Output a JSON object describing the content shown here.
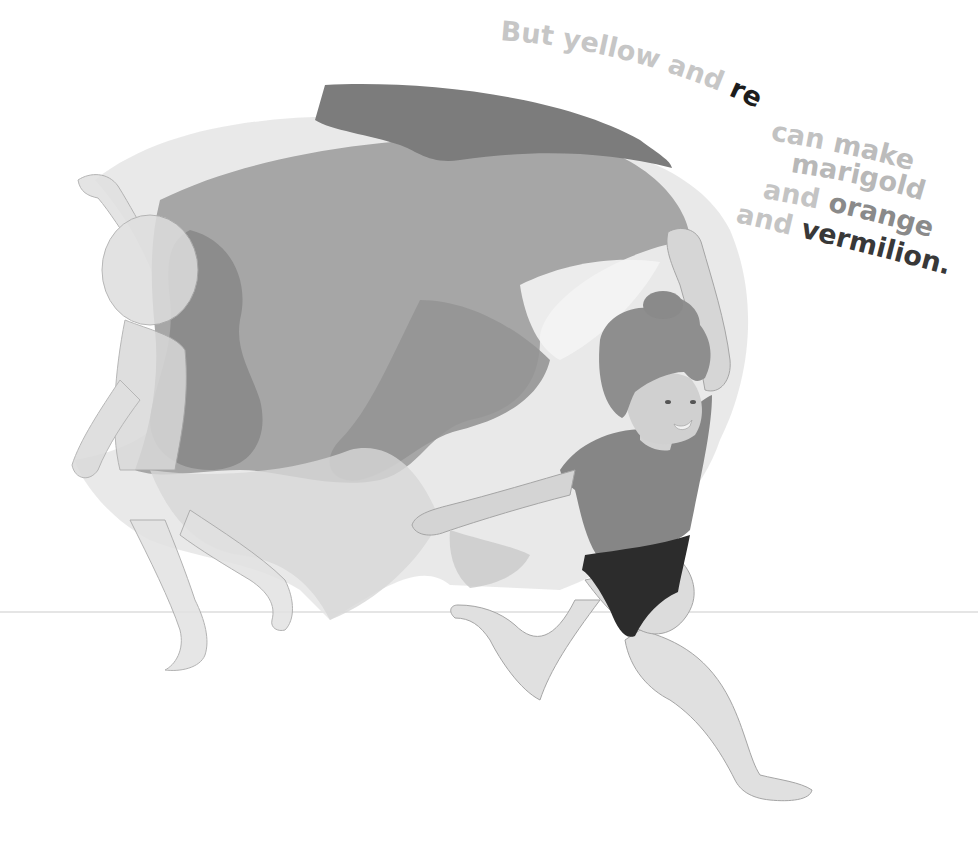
{
  "illustration": {
    "description": "Two children running, holding a large translucent flowing cloth between them",
    "palette": {
      "background": "#ffffff",
      "cloth_dark": "#7a7a7a",
      "cloth_mid": "#9a9a9a",
      "cloth_light": "#cfcfcf",
      "cloth_pale": "#e4e4e4",
      "skin": "#dadada",
      "skin_outline": "#9c9c9c",
      "hair": "#8e8e8e",
      "shirt": "#858585",
      "swimsuit": "#2e2e2e",
      "ground_line": "#d6d6d6"
    }
  },
  "text": {
    "words": [
      {
        "text": "But",
        "shade": "light",
        "color": "#c4c4c4"
      },
      {
        "text": "yellow",
        "shade": "light",
        "color": "#c4c4c4"
      },
      {
        "text": "and",
        "shade": "light",
        "color": "#c4c4c4"
      },
      {
        "text": "red",
        "shade": "dark",
        "color": "#1e1e1e"
      },
      {
        "text": "can",
        "shade": "light",
        "color": "#c4c4c4"
      },
      {
        "text": "make",
        "shade": "light",
        "color": "#bdbdbd"
      },
      {
        "text": "marigold",
        "shade": "light",
        "color": "#b9b9b9"
      },
      {
        "text": "and",
        "shade": "light",
        "color": "#c4c4c4"
      },
      {
        "text": "orange",
        "shade": "medium",
        "color": "#8c8c8c"
      },
      {
        "text": "and",
        "shade": "light",
        "color": "#c4c4c4"
      },
      {
        "text": "vermilion.",
        "shade": "dark",
        "color": "#3a3a3a"
      }
    ],
    "lines": [
      {
        "id": "line1",
        "parts": [
          "But",
          "yellow",
          "and",
          "red"
        ]
      },
      {
        "id": "line2",
        "parts": [
          "can",
          "make"
        ]
      },
      {
        "id": "line3",
        "parts": [
          "marigold"
        ]
      },
      {
        "id": "line4",
        "parts": [
          "and",
          "orange"
        ]
      },
      {
        "id": "line5",
        "parts": [
          "and",
          "vermilion."
        ]
      }
    ]
  }
}
